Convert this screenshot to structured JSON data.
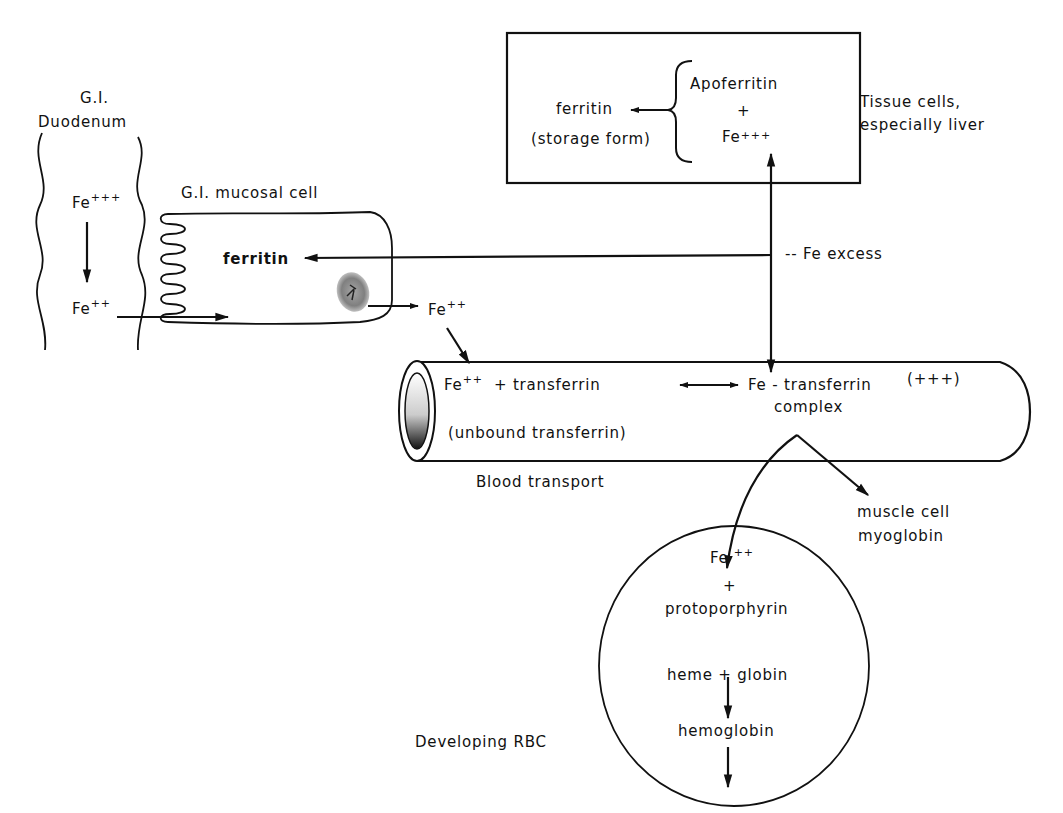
{
  "diagram": {
    "storage_box": {
      "ferritin": "ferritin",
      "storage_form": "(storage form)",
      "apoferritin": "Apoferritin",
      "plus": "+",
      "fe": "Fe",
      "fe_charge": "+++",
      "side_label_line1": "Tissue cells,",
      "side_label_line2": "especially liver"
    },
    "duodenum": {
      "title_line1": "G.I.",
      "title_line2": "Duodenum",
      "fe3": "Fe",
      "fe3_charge": "+++",
      "fe2": "Fe",
      "fe2_charge": "++"
    },
    "mucosal_cell": {
      "title": "G.I. mucosal cell",
      "ferritin": "ferritin",
      "fe_out": "Fe",
      "fe_out_charge": "++"
    },
    "fe_excess": "-- Fe excess",
    "blood": {
      "fe": "Fe",
      "fe_charge": "++",
      "plus_transferrin": "+ transferrin",
      "complex_line1": "Fe - transferrin",
      "complex_charge": "(+++)",
      "complex_line2": "complex",
      "unbound": "(unbound transferrin)",
      "caption": "Blood transport"
    },
    "muscle": {
      "line1": "muscle cell",
      "line2": "myoglobin"
    },
    "rbc": {
      "fe": "Fe",
      "fe_charge": "++",
      "plus": "+",
      "protoporphyrin": "protoporphyrin",
      "heme_globin": "heme + globin",
      "hemoglobin": "hemoglobin",
      "caption": "Developing RBC"
    }
  }
}
